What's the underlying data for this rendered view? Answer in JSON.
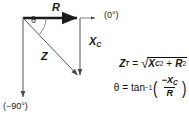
{
  "diagram": {
    "type": "impedance-phasor-vector-diagram",
    "colors": {
      "stroke": "#555555",
      "bold_stroke": "#1a1a1a",
      "text": "#111111",
      "background": "#ffffff"
    },
    "vectors": [
      {
        "name": "R",
        "label": "R",
        "from": [
          23,
          18
        ],
        "to": [
          80,
          18
        ],
        "style": "bold-horizontal-right"
      },
      {
        "name": "XC",
        "label": "X",
        "sub": "C",
        "from": [
          80,
          18
        ],
        "to": [
          80,
          78
        ],
        "style": "thin-vertical-down"
      },
      {
        "name": "Z",
        "label": "Z",
        "from": [
          23,
          18
        ],
        "to": [
          80,
          78
        ],
        "style": "thin-diagonal"
      },
      {
        "name": "ref-horizontal",
        "label": "(0°)",
        "from": [
          80,
          18
        ],
        "to": [
          99,
          18
        ],
        "style": "thin-reference-right"
      },
      {
        "name": "ref-vertical",
        "label": "(−90°)",
        "from": [
          23,
          18
        ],
        "to": [
          23,
          100
        ],
        "style": "thin-reference-down"
      }
    ],
    "angle": {
      "label": "θ",
      "symbol": "θ",
      "vertex": [
        23,
        18
      ],
      "arc": true
    },
    "axis_labels": {
      "zero_deg": "(0°)",
      "neg_ninety_deg": "(−90°)"
    },
    "vector_labels": {
      "R": "R",
      "Z": "Z",
      "XC": "X",
      "XC_sub": "C"
    }
  },
  "formulas": {
    "impedance": {
      "lhs": "Z",
      "lhs_sub": "T",
      "equals": "=",
      "radicand_a": "X",
      "radicand_a_sub": "C",
      "radicand_a_sup": "2",
      "plus": "+",
      "radicand_b": "R",
      "radicand_b_sup": "2",
      "plain_text": "Z_T = √(X_C² + R²)"
    },
    "phase": {
      "lhs": "θ",
      "equals": "=",
      "func": "tan",
      "func_sup": "−1",
      "numerator": "−X",
      "numerator_sub": "C",
      "denominator": "R",
      "plain_text": "θ = tan⁻¹(−X_C / R)"
    }
  }
}
